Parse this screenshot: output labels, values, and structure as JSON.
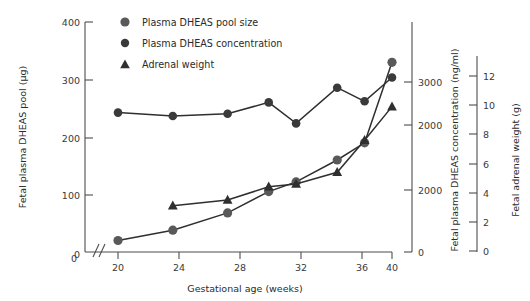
{
  "chart_data": {
    "type": "line",
    "title": "",
    "subtitle": "",
    "xlabel": "Gestational age (weeks)",
    "ylabel": "Fetal plasma DHEAS pool (µg)",
    "ylabel_right_inner": "Fetal plasma DHEAS concentration (ng/ml)",
    "ylabel_right_outer": "Fetal adrenal weight (g)",
    "grid": false,
    "legend_position": "top-left-inside",
    "x": [
      20,
      24,
      28,
      31,
      33,
      36,
      38,
      40
    ],
    "xlim": [
      19,
      41
    ],
    "x_ticks": [
      20,
      24,
      28,
      32,
      36,
      40
    ],
    "x_tick_labels": [
      "20",
      "24",
      "28",
      "32",
      "36",
      "40"
    ],
    "x_origin_label": "0",
    "axis_break_symbol": "//",
    "left_axis": {
      "label": "Fetal plasma DHEAS pool (µg)",
      "ticks": [
        0,
        100,
        200,
        300,
        400
      ],
      "tick_labels": [
        "0",
        "100",
        "200",
        "300",
        "400"
      ],
      "lim": [
        0,
        400
      ]
    },
    "right_inner_axis": {
      "label": "Fetal plasma DHEAS concentration (ng/ml)",
      "ticks": [
        0,
        1000,
        2000,
        3000
      ],
      "tick_labels": [
        "0",
        "2000",
        "2000",
        "3000"
      ],
      "lim": [
        0,
        3400
      ]
    },
    "right_outer_axis": {
      "label": "Fetal adrenal weight (g)",
      "ticks": [
        0,
        2,
        4,
        6,
        8,
        10,
        12
      ],
      "tick_labels": [
        "0",
        "2",
        "4",
        "6",
        "8",
        "10",
        "12"
      ],
      "lim": [
        0,
        13.2
      ]
    },
    "series": [
      {
        "name": "Plasma DHEAS pool size",
        "marker": "circle",
        "axis": "left",
        "units": "µg",
        "x": [
          20,
          24,
          28,
          31,
          33,
          36,
          38,
          40
        ],
        "values": [
          20,
          38,
          68,
          105,
          122,
          160,
          190,
          330
        ]
      },
      {
        "name": "Plasma DHEAS concentration",
        "marker": "circle",
        "axis": "right_inner",
        "units": "ng/ml",
        "x": [
          20,
          24,
          28,
          31,
          33,
          36,
          38,
          40
        ],
        "values": [
          2460,
          2400,
          2440,
          2640,
          2270,
          2900,
          2660,
          3080
        ]
      },
      {
        "name": "Adrenal weight",
        "marker": "triangle",
        "axis": "right_outer",
        "units": "g",
        "x": [
          24,
          28,
          31,
          33,
          36,
          38,
          40
        ],
        "values": [
          3.1,
          3.5,
          4.4,
          4.6,
          5.4,
          7.6,
          9.9
        ]
      }
    ],
    "colors": {
      "marker_pool": "#595959",
      "marker_concentration": "#3a3a3a",
      "marker_adrenal": "#2f2f2f",
      "line": "#2f2f2f",
      "axis": "#4d4d4d",
      "text": "#2b2b2b",
      "background": "#ffffff"
    }
  },
  "legend": {
    "items": [
      {
        "label": "Plasma DHEAS pool size",
        "marker": "circle-marker"
      },
      {
        "label": "Plasma DHEAS concentration",
        "marker": "circle-marker"
      },
      {
        "label": "Adrenal weight",
        "marker": "triangle-marker"
      }
    ]
  }
}
